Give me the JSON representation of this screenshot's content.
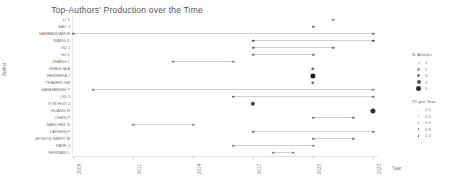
{
  "chart_data": {
    "type": "scatter",
    "title": "Top-Authors' Production over the Time",
    "xlabel": "Year",
    "ylabel": "Author",
    "xlim": [
      2008,
      2023
    ],
    "xticks": [
      2008,
      2011,
      2014,
      2017,
      2020,
      2023
    ],
    "xtick_labels": [
      "2008",
      "2011",
      "2014",
      "2017",
      "2020",
      "2023"
    ],
    "grid": false,
    "legend_position": "right",
    "marker_color_low": "#d9d9d9",
    "marker_color_high": "#3b3b3b",
    "line_color": "#cfcfcf",
    "authors": [
      {
        "name": "LI Y",
        "start": 2021,
        "end": 2021,
        "points": [
          {
            "year": 2021,
            "articles": 1,
            "tc": 0.4
          }
        ]
      },
      {
        "name": "BAO J",
        "start": 2020,
        "end": 2020,
        "points": [
          {
            "year": 2020,
            "articles": 1,
            "tc": 0.6
          }
        ]
      },
      {
        "name": "SAMBASIVAM M",
        "start": 2008,
        "end": 2023,
        "points": [
          {
            "year": 2008,
            "articles": 1,
            "tc": 0.5
          },
          {
            "year": 2023,
            "articles": 1,
            "tc": 0.5
          }
        ]
      },
      {
        "name": "WANG D",
        "start": 2017,
        "end": 2023,
        "points": [
          {
            "year": 2017,
            "articles": 1,
            "tc": 0.7
          },
          {
            "year": 2023,
            "articles": 1,
            "tc": 0.7
          }
        ]
      },
      {
        "name": "GU J",
        "start": 2017,
        "end": 2021,
        "points": [
          {
            "year": 2017,
            "articles": 1,
            "tc": 0.6
          },
          {
            "year": 2021,
            "articles": 1,
            "tc": 0.6
          }
        ]
      },
      {
        "name": "GU L",
        "start": 2017,
        "end": 2020,
        "points": [
          {
            "year": 2017,
            "articles": 1,
            "tc": 0.5
          },
          {
            "year": 2020,
            "articles": 1,
            "tc": 0.5
          }
        ]
      },
      {
        "name": "ZHANG L",
        "start": 2013,
        "end": 2016,
        "points": [
          {
            "year": 2013,
            "articles": 1,
            "tc": 0.4
          },
          {
            "year": 2016,
            "articles": 1,
            "tc": 0.4
          }
        ]
      },
      {
        "name": "GRAGLIA A",
        "start": 2020,
        "end": 2020,
        "points": [
          {
            "year": 2020,
            "articles": 2,
            "tc": 0.5
          }
        ]
      },
      {
        "name": "HERRERA J",
        "start": 2020,
        "end": 2020,
        "points": [
          {
            "year": 2020,
            "articles": 4,
            "tc": 1.0
          }
        ]
      },
      {
        "name": "TRAMER DM",
        "start": 2020,
        "end": 2020,
        "points": [
          {
            "year": 2020,
            "articles": 2,
            "tc": 0.5
          }
        ]
      },
      {
        "name": "SAMMAMISH Y",
        "start": 2009,
        "end": 2023,
        "points": [
          {
            "year": 2009,
            "articles": 1,
            "tc": 0.4
          },
          {
            "year": 2023,
            "articles": 1,
            "tc": 0.4
          }
        ]
      },
      {
        "name": "LIU J",
        "start": 2016,
        "end": 2023,
        "points": [
          {
            "year": 2016,
            "articles": 1,
            "tc": 0.5
          },
          {
            "year": 2023,
            "articles": 1,
            "tc": 0.5
          }
        ]
      },
      {
        "name": "VON HUG J",
        "start": 2017,
        "end": 2017,
        "points": [
          {
            "year": 2017,
            "articles": 3,
            "tc": 0.8
          }
        ]
      },
      {
        "name": "HUANG H",
        "start": 2023,
        "end": 2023,
        "points": [
          {
            "year": 2023,
            "articles": 4,
            "tc": 0.9
          }
        ]
      },
      {
        "name": "CHEN P",
        "start": 2020,
        "end": 2022,
        "points": [
          {
            "year": 2020,
            "articles": 1,
            "tc": 0.5
          },
          {
            "year": 2022,
            "articles": 1,
            "tc": 0.5
          }
        ]
      },
      {
        "name": "SANCHEZ S",
        "start": 2011,
        "end": 2014,
        "points": [
          {
            "year": 2011,
            "articles": 1,
            "tc": 0.4
          },
          {
            "year": 2014,
            "articles": 1,
            "tc": 0.4
          }
        ]
      },
      {
        "name": "LARSEN P",
        "start": 2017,
        "end": 2023,
        "points": [
          {
            "year": 2017,
            "articles": 1,
            "tc": 0.5
          },
          {
            "year": 2023,
            "articles": 1,
            "tc": 0.5
          }
        ]
      },
      {
        "name": "MONTGOMERY M",
        "start": 2020,
        "end": 2022,
        "points": [
          {
            "year": 2020,
            "articles": 1,
            "tc": 0.5
          },
          {
            "year": 2022,
            "articles": 1,
            "tc": 0.5
          }
        ]
      },
      {
        "name": "PARK J",
        "start": 2016,
        "end": 2020,
        "points": [
          {
            "year": 2016,
            "articles": 1,
            "tc": 0.4
          },
          {
            "year": 2020,
            "articles": 1,
            "tc": 0.4
          }
        ]
      },
      {
        "name": "FERRARI L",
        "start": 2018,
        "end": 2019,
        "points": [
          {
            "year": 2018,
            "articles": 1,
            "tc": 0.4
          },
          {
            "year": 2019,
            "articles": 1,
            "tc": 0.4
          }
        ]
      }
    ],
    "legends": [
      {
        "id": "articles",
        "title": "N. Articles",
        "entries": [
          {
            "label": "1",
            "size": 2.0,
            "shade": "#cccccc"
          },
          {
            "label": "2",
            "size": 2.8,
            "shade": "#9e9e9e"
          },
          {
            "label": "3",
            "size": 3.4,
            "shade": "#7a7a7a"
          },
          {
            "label": "4",
            "size": 4.0,
            "shade": "#565656"
          },
          {
            "label": "5",
            "size": 4.6,
            "shade": "#333333"
          }
        ]
      },
      {
        "id": "tc",
        "title": "TC per Year",
        "entries": [
          {
            "label": "0.2",
            "size": 1.6,
            "shade": "#e0e0e0"
          },
          {
            "label": "0.4",
            "size": 1.6,
            "shade": "#c2c2c2"
          },
          {
            "label": "0.6",
            "size": 1.6,
            "shade": "#9a9a9a"
          },
          {
            "label": "0.8",
            "size": 1.6,
            "shade": "#6e6e6e"
          },
          {
            "label": "1.0",
            "size": 1.6,
            "shade": "#3d3d3d"
          }
        ]
      }
    ]
  }
}
